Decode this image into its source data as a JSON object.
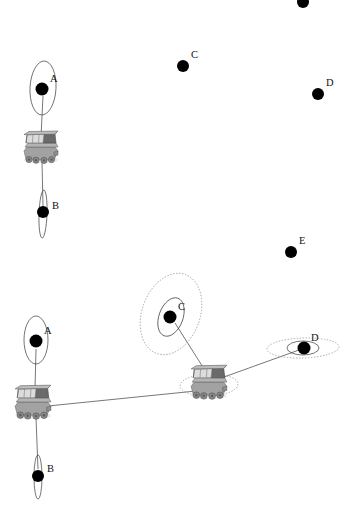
{
  "canvas": {
    "width": 358,
    "height": 512,
    "background": "#ffffff"
  },
  "style": {
    "dot_color": "#000000",
    "ellipse_solid_color": "#3a3a3a",
    "ellipse_dotted_color": "#8a8a8a",
    "edge_color": "#4a4a4a",
    "label_color": "#111111",
    "robot_body_color": "#9a9a9a",
    "robot_dark_color": "#5d5d5d",
    "robot_light_color": "#c8c8c8"
  },
  "panels": [
    {
      "id": "top-panel",
      "name": "initial-state",
      "landmarks": [
        {
          "id": "t-A",
          "label": "A",
          "x": 42,
          "y": 89,
          "r": 6.5,
          "label_dx": 8,
          "label_dy": -7,
          "observed": true
        },
        {
          "id": "t-B",
          "label": "B",
          "x": 43,
          "y": 212,
          "r": 6.0,
          "label_dx": 9,
          "label_dy": -3,
          "observed": true
        },
        {
          "id": "t-C",
          "label": "C",
          "x": 183,
          "y": 66,
          "r": 6.0,
          "label_dx": 8,
          "label_dy": -8,
          "observed": false
        },
        {
          "id": "t-D",
          "label": "D",
          "x": 318,
          "y": 94,
          "r": 6.0,
          "label_dx": 8,
          "label_dy": -8,
          "observed": false
        },
        {
          "id": "t-E",
          "label": "E",
          "x": 291,
          "y": 252,
          "r": 6.0,
          "label_dx": 8,
          "label_dy": -8,
          "observed": false
        },
        {
          "id": "t-F",
          "label": "",
          "x": 303,
          "y": 2,
          "r": 6.0,
          "label_dx": 0,
          "label_dy": 0,
          "observed": false
        }
      ],
      "uncertainty_ellipses": [
        {
          "for": "t-A",
          "cx": 43,
          "cy": 88,
          "rx": 13,
          "ry": 27,
          "rot": 3,
          "style": "solid"
        },
        {
          "for": "t-B",
          "cx": 43,
          "cy": 214,
          "rx": 4,
          "ry": 24,
          "rot": 2,
          "style": "solid"
        }
      ],
      "robot": {
        "id": "t-robot",
        "x": 41,
        "y": 147,
        "scale": 1.0
      },
      "edges": [
        {
          "from": "t-robot",
          "to": "t-A",
          "x1": 41,
          "y1": 137,
          "x2": 43,
          "y2": 96
        },
        {
          "from": "t-robot",
          "to": "t-B",
          "x1": 42,
          "y1": 162,
          "x2": 43,
          "y2": 206
        }
      ]
    },
    {
      "id": "bottom-panel",
      "name": "after-motion-state",
      "landmarks": [
        {
          "id": "b-A",
          "label": "A",
          "x": 36,
          "y": 341,
          "r": 6.5,
          "label_dx": 8,
          "label_dy": -8,
          "observed": true
        },
        {
          "id": "b-B",
          "label": "B",
          "x": 38,
          "y": 476,
          "r": 6.0,
          "label_dx": 9,
          "label_dy": -4,
          "observed": true
        },
        {
          "id": "b-C",
          "label": "C",
          "x": 170,
          "y": 317,
          "r": 6.5,
          "label_dx": 8,
          "label_dy": -8,
          "observed": true
        },
        {
          "id": "b-D",
          "label": "D",
          "x": 304,
          "y": 348,
          "r": 6.5,
          "label_dx": 7,
          "label_dy": -8,
          "observed": true
        }
      ],
      "uncertainty_ellipses": [
        {
          "for": "b-A",
          "cx": 36,
          "cy": 340,
          "rx": 12,
          "ry": 24,
          "rot": 0,
          "style": "solid"
        },
        {
          "for": "b-B",
          "cx": 38,
          "cy": 477,
          "rx": 4,
          "ry": 22,
          "rot": 0,
          "style": "solid"
        },
        {
          "for": "b-C",
          "cx": 171,
          "cy": 317,
          "rx": 12,
          "ry": 20,
          "rot": 20,
          "style": "solid"
        },
        {
          "for": "b-C",
          "cx": 171,
          "cy": 314,
          "rx": 29,
          "ry": 42,
          "rot": 20,
          "style": "dotted"
        },
        {
          "for": "b-D",
          "cx": 303,
          "cy": 348,
          "rx": 16,
          "ry": 7,
          "rot": 0,
          "style": "solid"
        },
        {
          "for": "b-D",
          "cx": 303,
          "cy": 348,
          "rx": 36,
          "ry": 10,
          "rot": -2,
          "style": "dotted"
        },
        {
          "for": "b-robot-2",
          "cx": 209,
          "cy": 385,
          "rx": 29,
          "ry": 11,
          "rot": -2,
          "style": "dotted"
        }
      ],
      "robots": [
        {
          "id": "b-robot-1",
          "x": 33,
          "y": 402,
          "scale": 1.05
        },
        {
          "id": "b-robot-2",
          "x": 209,
          "y": 382,
          "scale": 1.05
        }
      ],
      "edges": [
        {
          "from": "b-robot-1",
          "to": "b-A",
          "x1": 35,
          "y1": 389,
          "x2": 36,
          "y2": 349
        },
        {
          "from": "b-robot-1",
          "to": "b-B",
          "x1": 36,
          "y1": 418,
          "x2": 38,
          "y2": 469
        },
        {
          "from": "b-robot-1",
          "to": "b-robot-2",
          "x1": 48,
          "y1": 406,
          "x2": 196,
          "y2": 391
        },
        {
          "from": "b-robot-2",
          "to": "b-C",
          "x1": 206,
          "y1": 372,
          "x2": 175,
          "y2": 323
        },
        {
          "from": "b-robot-2",
          "to": "b-D",
          "x1": 224,
          "y1": 377,
          "x2": 299,
          "y2": 350
        }
      ]
    }
  ],
  "legend": {
    "landmark_name": "landmark",
    "robot_name": "robot",
    "ellipse_name": "uncertainty-ellipse",
    "edge_name": "observation-edge"
  }
}
